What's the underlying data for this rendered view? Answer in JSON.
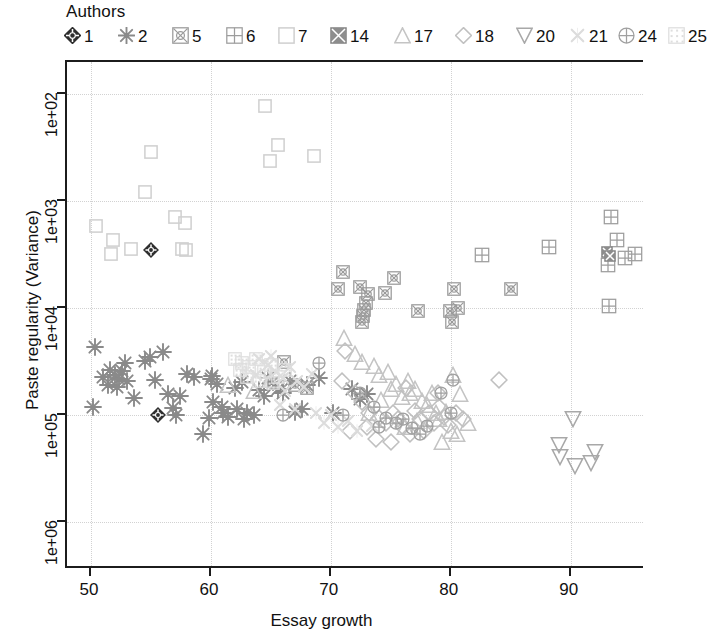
{
  "legend": {
    "title": "Authors",
    "items": [
      {
        "label": "1",
        "glyph": "diamond-cross-filled",
        "color": "#2e2e2e"
      },
      {
        "label": "2",
        "glyph": "asterisk",
        "color": "#8a8a8a"
      },
      {
        "label": "5",
        "glyph": "square-x-circle",
        "color": "#9a9a9a"
      },
      {
        "label": "6",
        "glyph": "square-grid",
        "color": "#9d9d9d"
      },
      {
        "label": "7",
        "glyph": "square-open",
        "color": "#cfcfcf"
      },
      {
        "label": "14",
        "glyph": "square-filled-x",
        "color": "#8d8d8d"
      },
      {
        "label": "17",
        "glyph": "triangle-up",
        "color": "#c4c4c4"
      },
      {
        "label": "18",
        "glyph": "diamond-open",
        "color": "#c0c0c0"
      },
      {
        "label": "20",
        "glyph": "triangle-down",
        "color": "#a8a8a8"
      },
      {
        "label": "21",
        "glyph": "x-cross",
        "color": "#dcdcdc"
      },
      {
        "label": "24",
        "glyph": "circle-plus",
        "color": "#a0a0a0"
      },
      {
        "label": "25",
        "glyph": "square-speckle",
        "color": "#dedede"
      }
    ]
  },
  "chart_data": {
    "type": "scatter",
    "title": "",
    "xlabel": "Essay growth",
    "ylabel": "Paste regularity (Variance)",
    "xlim": [
      48.0,
      96.2
    ],
    "ylim_log10": [
      1.7,
      6.45
    ],
    "y_inverted": true,
    "y_scale": "log",
    "grid": true,
    "legend_position": "top",
    "xticks": [
      50,
      60,
      70,
      80,
      90
    ],
    "yticks": [
      "1e+02",
      "1e+03",
      "1e+04",
      "1e+05",
      "1e+06"
    ],
    "ytick_values": [
      100,
      1000,
      10000,
      100000,
      1000000
    ],
    "series": [
      {
        "name": "1",
        "glyph": "diamond-cross-filled",
        "color": "#2e2e2e",
        "points": [
          [
            55.0,
            2900
          ],
          [
            55.6,
            100000
          ]
        ]
      },
      {
        "name": "2",
        "glyph": "asterisk",
        "color": "#8a8a8a",
        "points": [
          [
            50.3,
            23000
          ],
          [
            50.2,
            85000
          ],
          [
            51.0,
            44000
          ],
          [
            51.6,
            38000
          ],
          [
            52.0,
            42000
          ],
          [
            52.3,
            46000
          ],
          [
            52.6,
            39000
          ],
          [
            51.4,
            52000
          ],
          [
            52.2,
            55000
          ],
          [
            53.0,
            48000
          ],
          [
            52.8,
            33000
          ],
          [
            54.5,
            31000
          ],
          [
            54.9,
            29000
          ],
          [
            56.0,
            26000
          ],
          [
            56.4,
            64000
          ],
          [
            57.4,
            66000
          ],
          [
            57.1,
            100000
          ],
          [
            55.3,
            47000
          ],
          [
            58.0,
            41000
          ],
          [
            58.6,
            44000
          ],
          [
            59.3,
            150000
          ],
          [
            60.1,
            43000
          ],
          [
            60.0,
            46000
          ],
          [
            60.5,
            51000
          ],
          [
            60.2,
            76000
          ],
          [
            60.9,
            85000
          ],
          [
            61.0,
            96000
          ],
          [
            61.4,
            104000
          ],
          [
            62.0,
            56000
          ],
          [
            62.6,
            49000
          ],
          [
            62.2,
            88000
          ],
          [
            63.0,
            96000
          ],
          [
            63.6,
            100000
          ],
          [
            64.0,
            58000
          ],
          [
            64.4,
            67000
          ],
          [
            64.8,
            45000
          ],
          [
            65.2,
            49000
          ],
          [
            65.6,
            57000
          ],
          [
            66.0,
            62000
          ],
          [
            66.6,
            48000
          ],
          [
            67.0,
            94000
          ],
          [
            67.6,
            88000
          ],
          [
            68.0,
            52000
          ],
          [
            69.0,
            45000
          ],
          [
            70.2,
            96000
          ],
          [
            71.8,
            57000
          ],
          [
            72.4,
            71000
          ],
          [
            73.0,
            64000
          ],
          [
            53.6,
            70000
          ],
          [
            56.8,
            86000
          ],
          [
            59.8,
            106000
          ],
          [
            62.8,
            110000
          ]
        ]
      },
      {
        "name": "5",
        "glyph": "square-x-circle",
        "color": "#9a9a9a",
        "points": [
          [
            71.0,
            4600
          ],
          [
            70.6,
            6600
          ],
          [
            72.4,
            6300
          ],
          [
            73.1,
            7400
          ],
          [
            72.9,
            9000
          ],
          [
            72.8,
            10500
          ],
          [
            72.7,
            12000
          ],
          [
            72.6,
            13500
          ],
          [
            74.5,
            7200
          ],
          [
            75.3,
            5200
          ],
          [
            77.3,
            10600
          ],
          [
            79.9,
            10600
          ],
          [
            80.6,
            10000
          ],
          [
            80.1,
            13500
          ],
          [
            80.3,
            6600
          ],
          [
            66.1,
            32000
          ],
          [
            67.0,
            52000
          ],
          [
            68.0,
            56000
          ],
          [
            85.0,
            6600
          ]
        ]
      },
      {
        "name": "6",
        "glyph": "square-grid",
        "color": "#9d9d9d",
        "points": [
          [
            82.6,
            3200
          ],
          [
            88.2,
            2700
          ],
          [
            93.4,
            1400
          ],
          [
            93.9,
            2300
          ],
          [
            93.1,
            4000
          ],
          [
            94.5,
            3400
          ],
          [
            93.2,
            9500
          ],
          [
            95.4,
            3100
          ]
        ]
      },
      {
        "name": "7",
        "glyph": "square-open",
        "color": "#cfcfcf",
        "points": [
          [
            50.4,
            1700
          ],
          [
            51.8,
            2300
          ],
          [
            51.7,
            3100
          ],
          [
            53.3,
            2800
          ],
          [
            55.0,
            350
          ],
          [
            57.0,
            1400
          ],
          [
            57.8,
            1600
          ],
          [
            57.6,
            2800
          ],
          [
            57.9,
            2900
          ],
          [
            64.5,
            130
          ],
          [
            64.9,
            420
          ],
          [
            65.6,
            300
          ],
          [
            68.6,
            380
          ],
          [
            54.5,
            820
          ]
        ]
      },
      {
        "name": "14",
        "glyph": "square-filled-x",
        "color": "#8d8d8d",
        "points": [
          [
            83.5,
            3500000
          ],
          [
            93.0,
            3000
          ],
          [
            93.3,
            3300
          ]
        ]
      },
      {
        "name": "17",
        "glyph": "triangle-up",
        "color": "#c4c4c4",
        "points": [
          [
            61.4,
            52000
          ],
          [
            63.6,
            60000
          ],
          [
            65.0,
            47000
          ],
          [
            71.1,
            19000
          ],
          [
            72.0,
            27000
          ],
          [
            72.6,
            32000
          ],
          [
            73.6,
            35000
          ],
          [
            74.0,
            42000
          ],
          [
            74.8,
            40000
          ],
          [
            75.4,
            51000
          ],
          [
            75.0,
            57000
          ],
          [
            75.9,
            68000
          ],
          [
            76.4,
            48000
          ],
          [
            76.6,
            62000
          ],
          [
            77.0,
            57000
          ],
          [
            77.6,
            74000
          ],
          [
            78.0,
            80000
          ],
          [
            78.4,
            62000
          ],
          [
            78.8,
            96000
          ],
          [
            79.0,
            110000
          ],
          [
            79.6,
            93000
          ],
          [
            80.0,
            140000
          ],
          [
            80.5,
            150000
          ],
          [
            80.8,
            64000
          ],
          [
            81.4,
            120000
          ],
          [
            79.3,
            180000
          ],
          [
            77.2,
            115000
          ],
          [
            73.2,
            95000
          ],
          [
            76.2,
            130000
          ],
          [
            74.2,
            72000
          ],
          [
            80.2,
            42000
          ]
        ]
      },
      {
        "name": "18",
        "glyph": "diamond-open",
        "color": "#c0c0c0",
        "points": [
          [
            71.2,
            25000
          ],
          [
            70.9,
            48000
          ],
          [
            72.0,
            63000
          ],
          [
            72.6,
            76000
          ],
          [
            73.2,
            96000
          ],
          [
            73.0,
            130000
          ],
          [
            74.0,
            106000
          ],
          [
            74.6,
            120000
          ],
          [
            75.2,
            96000
          ],
          [
            75.6,
            108000
          ],
          [
            76.0,
            130000
          ],
          [
            76.6,
            150000
          ],
          [
            77.0,
            92000
          ],
          [
            77.4,
            110000
          ],
          [
            77.8,
            140000
          ],
          [
            78.2,
            96000
          ],
          [
            78.6,
            120000
          ],
          [
            79.0,
            84000
          ],
          [
            79.4,
            104000
          ],
          [
            79.8,
            124000
          ],
          [
            80.4,
            96000
          ],
          [
            81.0,
            108000
          ],
          [
            84.0,
            47000
          ],
          [
            78.9,
            62000
          ],
          [
            76.3,
            56000
          ],
          [
            75.0,
            180000
          ],
          [
            73.8,
            168000
          ],
          [
            71.6,
            140000
          ]
        ]
      },
      {
        "name": "20",
        "glyph": "triangle-down",
        "color": "#a8a8a8",
        "points": [
          [
            90.2,
            110000
          ],
          [
            89.0,
            190000
          ],
          [
            89.1,
            250000
          ],
          [
            90.4,
            300000
          ],
          [
            91.7,
            280000
          ],
          [
            92.0,
            220000
          ],
          [
            90.5,
            3500000
          ]
        ]
      },
      {
        "name": "21",
        "glyph": "x-cross",
        "color": "#dcdcdc",
        "points": [
          [
            64.0,
            30000
          ],
          [
            64.8,
            34000
          ],
          [
            65.4,
            40000
          ],
          [
            66.0,
            45000
          ],
          [
            66.6,
            36000
          ],
          [
            67.2,
            48000
          ],
          [
            67.8,
            55000
          ],
          [
            68.4,
            41000
          ],
          [
            65.0,
            28000
          ],
          [
            66.2,
            60000
          ],
          [
            68.8,
            96000
          ],
          [
            69.4,
            120000
          ],
          [
            70.0,
            100000
          ],
          [
            70.6,
            130000
          ],
          [
            71.4,
            115000
          ],
          [
            72.2,
            140000
          ],
          [
            65.8,
            80000
          ],
          [
            67.0,
            88000
          ],
          [
            63.8,
            42000
          ],
          [
            73.4,
            128000
          ]
        ]
      },
      {
        "name": "24",
        "glyph": "circle-plus",
        "color": "#a0a0a0",
        "points": [
          [
            66.0,
            100000
          ],
          [
            69.0,
            33000
          ],
          [
            71.0,
            100000
          ],
          [
            72.4,
            62000
          ],
          [
            73.6,
            84000
          ],
          [
            74.6,
            106000
          ],
          [
            75.4,
            120000
          ],
          [
            76.0,
            108000
          ],
          [
            76.8,
            132000
          ],
          [
            78.0,
            126000
          ],
          [
            79.2,
            62000
          ],
          [
            80.2,
            47000
          ],
          [
            74.0,
            130000
          ],
          [
            77.4,
            150000
          ],
          [
            80.0,
            96000
          ]
        ]
      },
      {
        "name": "25",
        "glyph": "square-speckle",
        "color": "#dedede",
        "points": [
          [
            62.0,
            30000
          ],
          [
            62.6,
            33000
          ],
          [
            63.2,
            36000
          ],
          [
            63.8,
            30000
          ],
          [
            64.4,
            40000
          ],
          [
            65.0,
            34000
          ],
          [
            65.6,
            44000
          ],
          [
            66.2,
            38000
          ],
          [
            63.0,
            44000
          ],
          [
            64.0,
            48000
          ],
          [
            62.4,
            38000
          ],
          [
            65.2,
            50000
          ]
        ]
      }
    ]
  }
}
